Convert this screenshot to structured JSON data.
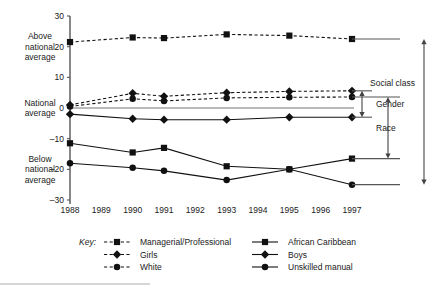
{
  "chart_data": {
    "type": "line",
    "title": "",
    "xlabel": "",
    "ylabel": "",
    "grid": false,
    "legend_position": "bottom",
    "x": [
      1988,
      1989,
      1990,
      1991,
      1992,
      1993,
      1994,
      1995,
      1996,
      1997
    ],
    "marker_years": [
      1988,
      1990,
      1991,
      1993,
      1995,
      1997
    ],
    "ylim": [
      -30,
      30
    ],
    "yticks": [
      30,
      20,
      10,
      0,
      -10,
      -20,
      -30
    ],
    "ytick_labels": [
      "30",
      "20",
      "10",
      "0",
      "–10",
      "–20",
      "–30"
    ],
    "xtick_labels": [
      "1988",
      "1989",
      "1990",
      "1991",
      "1992",
      "1993",
      "1994",
      "1995",
      "1996",
      "1997"
    ],
    "y_region_labels": [
      {
        "text": "Above national average",
        "value": 20
      },
      {
        "text": "National average",
        "value": 0
      },
      {
        "text": "Below national average",
        "value": -20
      }
    ],
    "series": [
      {
        "name": "Managerial/Professional",
        "style": "dashed",
        "marker": "square",
        "points": [
          [
            1988,
            21.5
          ],
          [
            1990,
            23.0
          ],
          [
            1991,
            22.8
          ],
          [
            1993,
            24.0
          ],
          [
            1995,
            23.6
          ],
          [
            1997,
            22.5
          ]
        ]
      },
      {
        "name": "Girls",
        "style": "dashed",
        "marker": "diamond",
        "points": [
          [
            1988,
            1.0
          ],
          [
            1990,
            4.8
          ],
          [
            1991,
            3.8
          ],
          [
            1993,
            5.0
          ],
          [
            1995,
            5.4
          ],
          [
            1997,
            5.6
          ]
        ]
      },
      {
        "name": "White",
        "style": "dashed",
        "marker": "circle",
        "points": [
          [
            1988,
            0.5
          ],
          [
            1990,
            3.0
          ],
          [
            1991,
            2.3
          ],
          [
            1993,
            3.3
          ],
          [
            1995,
            3.5
          ],
          [
            1997,
            3.6
          ]
        ]
      },
      {
        "name": "African Caribbean",
        "style": "solid",
        "marker": "square",
        "points": [
          [
            1988,
            -11.5
          ],
          [
            1990,
            -14.5
          ],
          [
            1991,
            -13.0
          ],
          [
            1993,
            -19.0
          ],
          [
            1995,
            -20.0
          ],
          [
            1997,
            -16.5
          ]
        ]
      },
      {
        "name": "Boys",
        "style": "solid",
        "marker": "diamond",
        "points": [
          [
            1988,
            -2.0
          ],
          [
            1990,
            -3.5
          ],
          [
            1991,
            -3.8
          ],
          [
            1993,
            -3.8
          ],
          [
            1995,
            -3.0
          ],
          [
            1997,
            -3.0
          ]
        ]
      },
      {
        "name": "Unskilled manual",
        "style": "solid",
        "marker": "circle",
        "points": [
          [
            1988,
            -18.0
          ],
          [
            1990,
            -19.5
          ],
          [
            1991,
            -20.5
          ],
          [
            1993,
            -23.5
          ],
          [
            1995,
            -20.0
          ],
          [
            1997,
            -25.0
          ]
        ]
      }
    ],
    "annotations": [
      {
        "label": "Social class",
        "from": 22.5,
        "to": -25.0
      },
      {
        "label": "Gender",
        "from": 5.6,
        "to": -3.0
      },
      {
        "label": "Race",
        "from": 3.6,
        "to": -16.5
      }
    ]
  },
  "legend": {
    "key_label": "Key:",
    "left_column": [
      {
        "label": "Managerial/Professional",
        "style": "dashed",
        "marker": "square"
      },
      {
        "label": "Girls",
        "style": "dashed",
        "marker": "diamond"
      },
      {
        "label": "White",
        "style": "dashed",
        "marker": "circle"
      }
    ],
    "right_column": [
      {
        "label": "African Caribbean",
        "style": "solid",
        "marker": "square"
      },
      {
        "label": "Boys",
        "style": "solid",
        "marker": "diamond"
      },
      {
        "label": "Unskilled manual",
        "style": "solid",
        "marker": "circle"
      }
    ]
  },
  "colors": {
    "ink": "#111111",
    "axis": "#555555",
    "background": "#ffffff"
  }
}
